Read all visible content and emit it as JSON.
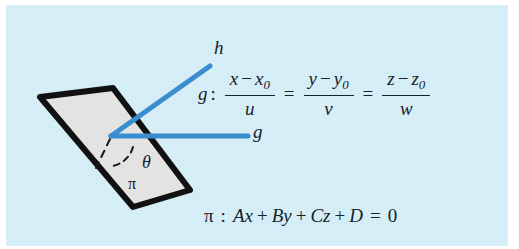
{
  "figure": {
    "background_color": "#ffffff",
    "panel_color": "#d3edf6",
    "ink_color": "#16212b",
    "line_color": "#3a8ed0",
    "plane_fill": "#e3e3e1",
    "plane_stroke": "#111111"
  },
  "labels": {
    "line_h": "h",
    "line_g": "g",
    "angle_theta": "θ",
    "plane_pi": "π"
  },
  "line_equation": {
    "name": "g",
    "colon": ":",
    "equals": "=",
    "fractions": [
      {
        "num_var": "x",
        "minus": "−",
        "num_point": "x",
        "num_point_sub": "0",
        "den": "u"
      },
      {
        "num_var": "y",
        "minus": "−",
        "num_point": "y",
        "num_point_sub": "0",
        "den": "v"
      },
      {
        "num_var": "z",
        "minus": "−",
        "num_point": "z",
        "num_point_sub": "0",
        "den": "w"
      }
    ],
    "plain_text": "g : (x - x0)/u = (y - y0)/v = (z - z0)/w"
  },
  "plane_equation": {
    "name": "π",
    "colon": ":",
    "term_a": "Ax",
    "plus_1": "+",
    "term_b": "By",
    "plus_2": "+",
    "term_c": "Cz",
    "plus_3": "+",
    "term_d": "D",
    "equals": "=",
    "rhs": "0",
    "plain_text": "π : Ax + By + Cz + D = 0"
  },
  "geometry": {
    "plane_polygon": "40,97 113,88 190,190 133,207",
    "vertex": {
      "x": 111,
      "y": 135
    },
    "line_h_end": {
      "x": 210,
      "y": 66
    },
    "line_g_end": {
      "x": 248,
      "y": 136
    },
    "normal_dash_end": {
      "x": 96,
      "y": 168
    },
    "angle_arc": "M 131,145 A 24 24 0 0 1 115,163"
  }
}
